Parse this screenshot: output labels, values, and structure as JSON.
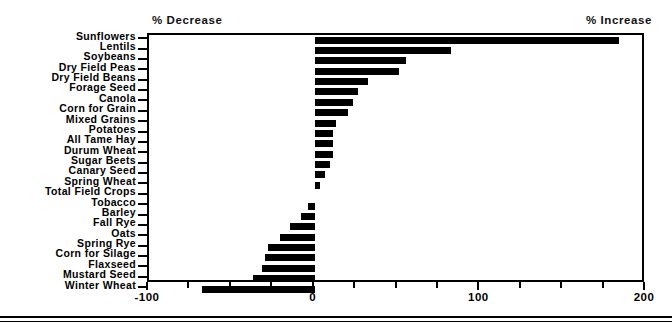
{
  "annotations": {
    "decrease_label": "% Decrease",
    "increase_label": "% Increase"
  },
  "chart_data": {
    "type": "bar",
    "orientation": "horizontal",
    "title": "",
    "subtitle": "",
    "xlabel": "",
    "ylabel": "",
    "xlim": [
      -100,
      200
    ],
    "xticks": [
      -100,
      0,
      100,
      200
    ],
    "xtick_labels": [
      "-100",
      "0",
      "100",
      "200"
    ],
    "minor_tick_step": 25,
    "grid": false,
    "legend": null,
    "bar_color": "#000000",
    "background_color": "#FFFFFF",
    "annotations": [
      "% Decrease",
      "% Increase"
    ],
    "categories": [
      "Sunflowers",
      "Lentils",
      "Soybeans",
      "Dry Field Peas",
      "Dry Field Beans",
      "Forage Seed",
      "Canola",
      "Corn for Grain",
      "Mixed Grains",
      "Potatoes",
      "All Tame Hay",
      "Durum Wheat",
      "Sugar Beets",
      "Canary Seed",
      "Spring Wheat",
      "Total Field Crops",
      "Tobacco",
      "Barley",
      "Fall Rye",
      "Oats",
      "Spring Rye",
      "Corn for Silage",
      "Flaxseed",
      "Mustard Seed",
      "Winter Wheat"
    ],
    "values": [
      184,
      82,
      55,
      51,
      32,
      26,
      23,
      20,
      13,
      11,
      11,
      11,
      9,
      6,
      3,
      0,
      -4,
      -8,
      -15,
      -21,
      -28,
      -30,
      -32,
      -37,
      -68
    ]
  }
}
